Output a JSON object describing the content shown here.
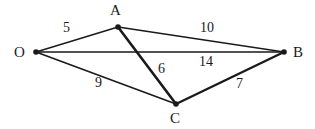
{
  "figure": {
    "background_color": "#ffffff",
    "stroke_color": "#1a1a1a",
    "width": 315,
    "height": 129
  },
  "vertices": [
    {
      "id": "O",
      "label": "O",
      "x": 36,
      "y": 52,
      "label_x": 14,
      "label_y": 45
    },
    {
      "id": "A",
      "label": "A",
      "x": 118,
      "y": 27,
      "label_x": 110,
      "label_y": 3
    },
    {
      "id": "B",
      "label": "B",
      "x": 284,
      "y": 52,
      "label_x": 293,
      "label_y": 45
    },
    {
      "id": "C",
      "label": "C",
      "x": 176,
      "y": 104,
      "label_x": 170,
      "label_y": 111
    }
  ],
  "edges": [
    {
      "id": "O-A",
      "from": "O",
      "to": "A",
      "weight": "5",
      "weight_x": 63,
      "weight_y": 21,
      "thickness": 1.4
    },
    {
      "id": "A-B",
      "from": "A",
      "to": "B",
      "weight": "10",
      "weight_x": 200,
      "weight_y": 21,
      "thickness": 1.4
    },
    {
      "id": "O-B",
      "from": "O",
      "to": "B",
      "weight": "14",
      "weight_x": 199,
      "weight_y": 55,
      "thickness": 1.6
    },
    {
      "id": "A-C",
      "from": "A",
      "to": "C",
      "weight": "6",
      "weight_x": 158,
      "weight_y": 62,
      "thickness": 2.6
    },
    {
      "id": "O-C",
      "from": "O",
      "to": "C",
      "weight": "9",
      "weight_x": 95,
      "weight_y": 76,
      "thickness": 1.6
    },
    {
      "id": "C-B",
      "from": "C",
      "to": "B",
      "weight": "7",
      "weight_x": 236,
      "weight_y": 77,
      "thickness": 2.4
    }
  ],
  "chart_data": {
    "type": "diagram",
    "subtype": "weighted-undirected-graph",
    "nodes": [
      "O",
      "A",
      "B",
      "C"
    ],
    "edges": [
      {
        "source": "O",
        "target": "A",
        "weight": 5
      },
      {
        "source": "A",
        "target": "B",
        "weight": 10
      },
      {
        "source": "O",
        "target": "B",
        "weight": 14
      },
      {
        "source": "A",
        "target": "C",
        "weight": 6
      },
      {
        "source": "O",
        "target": "C",
        "weight": 9
      },
      {
        "source": "C",
        "target": "B",
        "weight": 7
      }
    ]
  }
}
